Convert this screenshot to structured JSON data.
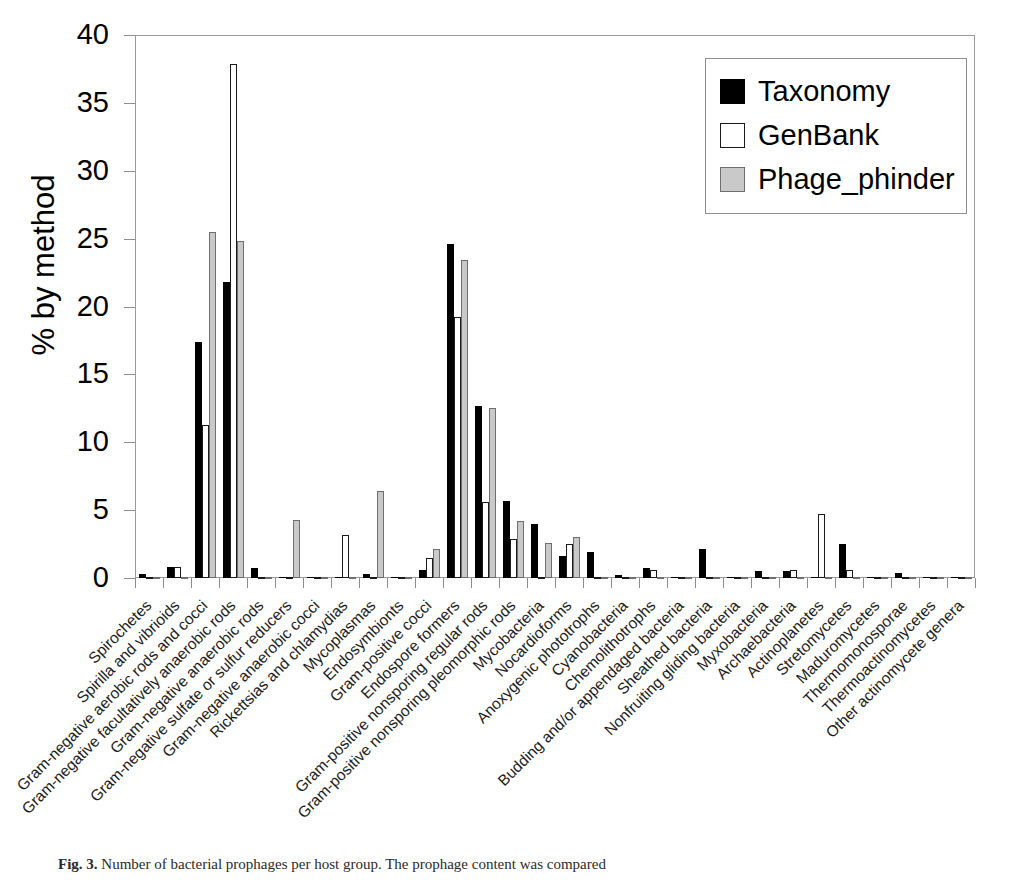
{
  "figure": {
    "caption_prefix": "Fig. 3.",
    "caption_text": "Number of bacterial prophages per host group. The prophage content was compared"
  },
  "legend": {
    "position": "upper-right",
    "items": [
      {
        "label": "Taxonomy",
        "color": "#000000",
        "swatch": "filled-black-square"
      },
      {
        "label": "GenBank",
        "color": "#ffffff",
        "swatch": "open-white-square"
      },
      {
        "label": "Phage_phinder",
        "color": "#c9c9c9",
        "swatch": "filled-gray-square"
      }
    ]
  },
  "axes": {
    "ylabel": "% by method",
    "xlabel": "",
    "yticks": [
      0,
      5,
      10,
      15,
      20,
      25,
      30,
      35,
      40
    ],
    "ytick_labels": [
      "0",
      "5",
      "10",
      "15",
      "20",
      "25",
      "30",
      "35",
      "40"
    ],
    "ylim": [
      0,
      40
    ],
    "grid": false,
    "label_rotation_deg": 45
  },
  "chart_data": {
    "type": "bar",
    "title": "",
    "xlabel": "",
    "ylabel": "% by method",
    "ylim": [
      0,
      40
    ],
    "grid": false,
    "legend_position": "upper right",
    "categories": [
      "Spirochetes",
      "Spirilla and vibrioids",
      "Gram-negative aerobic rods and  cocci",
      "Gram-negative facultatively  anaerobic rods",
      "Gram-negative anaerobic rods",
      "Gram-negative sulfate or sulfur reducers",
      "Gram-negative anaerobic  cocci",
      "Rickettsias and chlamydias",
      "Mycoplasmas",
      "Endosymbionts",
      "Gram-positive cocci",
      "Endospore formers",
      "Gram-positive nonsporing regular rods",
      "Gram-positive nonsporing pleomorphic  rods",
      "Mycobacteria",
      "Nocardioforms",
      "Anoxygenic phototrophs",
      "Cyanobacteria",
      "Chemolithotrophs",
      "Budding and/or appendaged  bacteria",
      "Sheathed bacteria",
      "Nonfruiting gliding bacteria",
      "Myxobacteria",
      "Archaebacteria",
      "Actinoplanetes",
      "Stretomycetes",
      "Maduromycetes",
      "Thermomonosporae",
      "Thermoactinomycetes",
      "Other actinomycete genera"
    ],
    "series": [
      {
        "name": "Taxonomy",
        "color": "#000000",
        "values": [
          0.3,
          0.8,
          17.4,
          21.8,
          0.7,
          0.1,
          0.05,
          0.1,
          0.3,
          0.05,
          0.6,
          24.6,
          12.7,
          5.7,
          4.0,
          1.6,
          1.9,
          0.2,
          0.7,
          0.1,
          2.1,
          0.05,
          0.5,
          0.5,
          0.1,
          2.5,
          0.1,
          0.4,
          0.05,
          0.1
        ]
      },
      {
        "name": "GenBank",
        "color": "#ffffff",
        "values": [
          0.1,
          0.8,
          11.3,
          37.9,
          0.1,
          0.1,
          0.05,
          3.2,
          0.1,
          0.05,
          1.5,
          19.2,
          5.6,
          2.9,
          0.1,
          2.5,
          0.1,
          0.1,
          0.6,
          0.1,
          0.1,
          0.05,
          0.1,
          0.6,
          4.7,
          0.6,
          0.05,
          0.05,
          0.05,
          0.1
        ]
      },
      {
        "name": "Phage_phinder",
        "color": "#c9c9c9",
        "values": [
          0.1,
          0.1,
          25.5,
          24.8,
          0.1,
          4.3,
          0.1,
          0.1,
          6.4,
          0.05,
          2.1,
          23.4,
          12.5,
          4.2,
          2.6,
          3.0,
          0.1,
          0.1,
          0.1,
          0.1,
          0.1,
          0.05,
          0.1,
          0.1,
          0.1,
          0.1,
          0.05,
          0.05,
          0.1,
          0.05
        ]
      }
    ]
  }
}
